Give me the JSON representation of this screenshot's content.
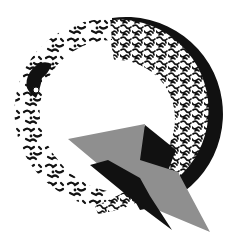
{
  "logo": {
    "letter": "Q",
    "alt": "Stylized Q logo",
    "colors": {
      "background": "#ffffff",
      "ink": "#111111",
      "grey": "#8f8f8f"
    },
    "elements": [
      {
        "name": "textured-ring-left",
        "style": "sparse black coral pattern"
      },
      {
        "name": "textured-crescent-right",
        "style": "dense maze pattern"
      },
      {
        "name": "outer-rim-right",
        "style": "solid black"
      },
      {
        "name": "grey-triangle",
        "style": "flat grey"
      },
      {
        "name": "black-tail",
        "style": "solid black wedge"
      }
    ]
  }
}
